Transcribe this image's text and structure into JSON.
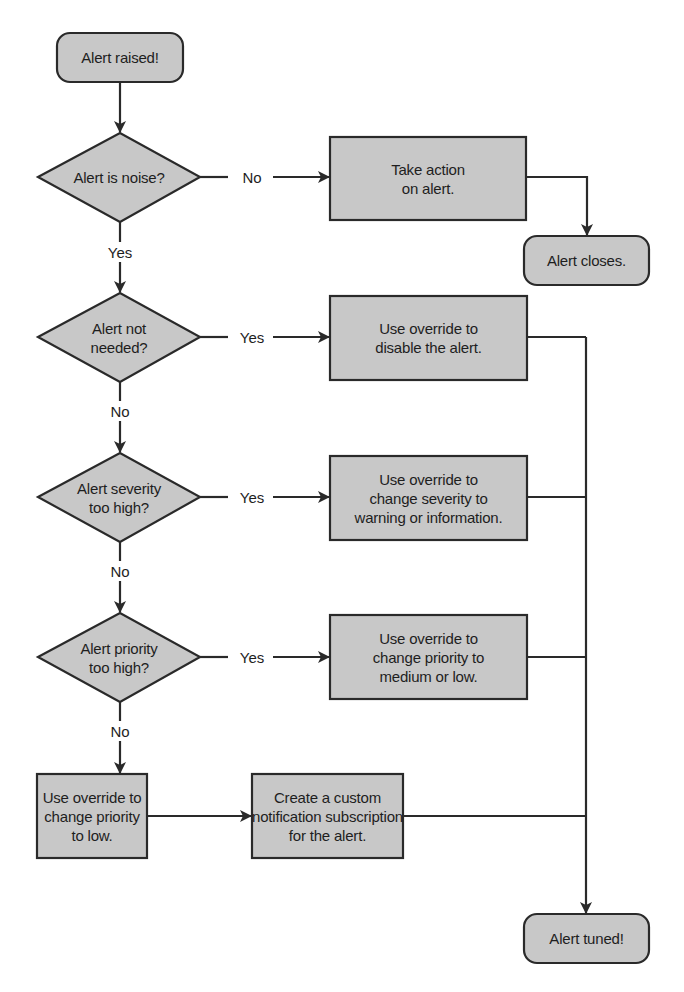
{
  "diagram": {
    "type": "flowchart",
    "colors": {
      "fill": "#c8c8c8",
      "stroke": "#2a2a2a",
      "background": "#ffffff"
    },
    "nodes": {
      "start": "Alert raised!",
      "q_noise": "Alert is noise?",
      "act": "Take action\non alert.",
      "closes": "Alert closes.",
      "q_not_needed": "Alert not\nneeded?",
      "disable": "Use override to\ndisable the alert.",
      "q_severity": "Alert severity\ntoo high?",
      "severity": "Use override to\nchange severity to\nwarning or information.",
      "q_priority": "Alert priority\ntoo high?",
      "priority_med": "Use override to\nchange priority to\nmedium or low.",
      "priority_low": "Use override to\nchange priority\nto low.",
      "subscription": "Create a custom\nnotification subscription\nfor the alert.",
      "tuned": "Alert tuned!"
    },
    "edge_labels": {
      "noise_no": "No",
      "noise_yes": "Yes",
      "not_needed_yes": "Yes",
      "not_needed_no": "No",
      "severity_yes": "Yes",
      "severity_no": "No",
      "priority_yes": "Yes",
      "priority_no": "No"
    }
  }
}
